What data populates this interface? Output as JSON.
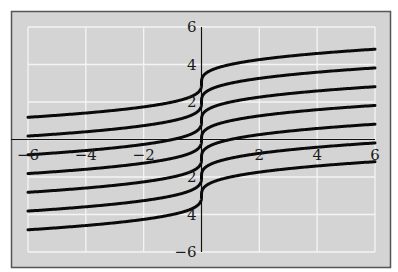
{
  "chart_data": {
    "type": "line",
    "title": "",
    "xlabel": "",
    "ylabel": "",
    "xlim": [
      -6,
      6
    ],
    "ylim": [
      -6,
      6
    ],
    "grid": true,
    "function": "y = x^(1/3) + C",
    "x_ticks": [
      {
        "value": -6,
        "label": "−6"
      },
      {
        "value": -4,
        "label": "−4"
      },
      {
        "value": -2,
        "label": "−2"
      },
      {
        "value": 2,
        "label": "2"
      },
      {
        "value": 4,
        "label": "4"
      },
      {
        "value": 6,
        "label": "6"
      }
    ],
    "y_ticks": [
      {
        "value": 6,
        "label": "6"
      },
      {
        "value": 4,
        "label": "4"
      },
      {
        "value": 2,
        "label": "2"
      },
      {
        "value": -2,
        "label": "2"
      },
      {
        "value": -4,
        "label": "4"
      },
      {
        "value": -6,
        "label": "−6"
      }
    ],
    "series": [
      {
        "name": "C=3",
        "C": 3
      },
      {
        "name": "C=2",
        "C": 2
      },
      {
        "name": "C=1",
        "C": 1
      },
      {
        "name": "C=0",
        "C": 0
      },
      {
        "name": "C=-1",
        "C": -1
      },
      {
        "name": "C=-2",
        "C": -2
      },
      {
        "name": "C=-3",
        "C": -3
      }
    ],
    "colors": {
      "background": "#d4d4d4",
      "grid": "#f4f4f4",
      "curve": "#0a0a0a",
      "axis": "#111111",
      "frame": "#555555"
    }
  }
}
